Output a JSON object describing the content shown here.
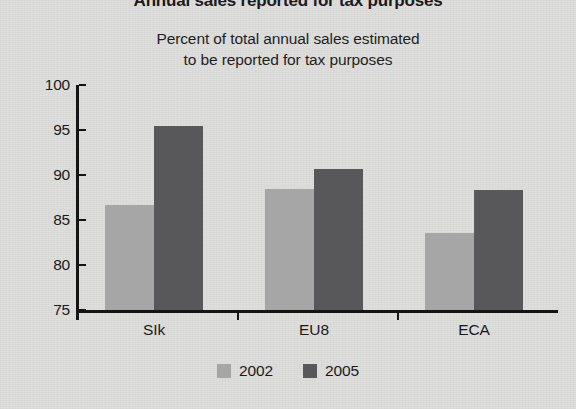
{
  "page": {
    "title": "Annual sales reported for tax purposes",
    "background_color": "#dcdcdb"
  },
  "chart_data": {
    "type": "bar",
    "title": "Annual sales reported for tax purposes",
    "subtitle_line1": "Percent of total annual sales estimated",
    "subtitle_line2": "to be reported for tax purposes",
    "xlabel": "",
    "ylabel": "",
    "ylim": [
      75,
      100
    ],
    "yticks": [
      75,
      80,
      85,
      90,
      95,
      100
    ],
    "ytick_labels": [
      "75",
      "80",
      "85",
      "90",
      "95",
      "100"
    ],
    "grid": false,
    "legend_position": "bottom",
    "categories": [
      "SIk",
      "EU8",
      "ECA"
    ],
    "series": [
      {
        "name": "2002",
        "color": "#a6a6a6",
        "values": [
          86.7,
          88.4,
          83.6
        ]
      },
      {
        "name": "2005",
        "color": "#58585a",
        "values": [
          95.4,
          90.7,
          88.3
        ]
      }
    ]
  }
}
